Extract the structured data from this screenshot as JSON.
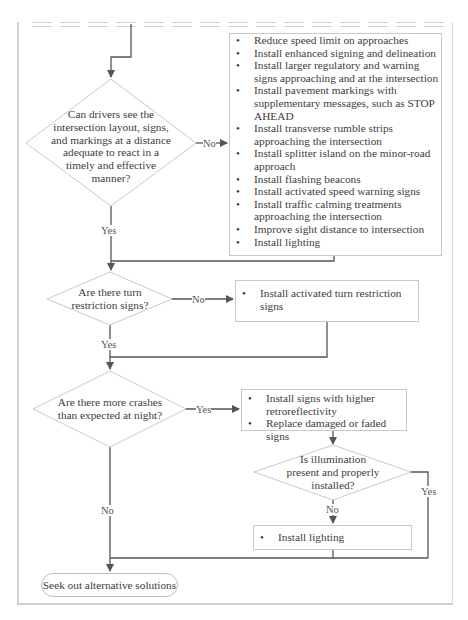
{
  "flowchart": {
    "decision_1": {
      "question": "Can drivers see the intersection layout, signs, and markings at a distance adequate to react in a timely and effective manner?",
      "lines": [
        "Can drivers see the",
        "intersection layout, signs,",
        "and markings at a distance",
        "adequate to react in a",
        "timely and effective",
        "manner?"
      ],
      "no_label": "No",
      "yes_label": "Yes"
    },
    "actions_1": [
      "Reduce speed limit on approaches",
      "Install enhanced signing and delineation",
      "Install larger regulatory and warning signs approaching and at the intersection",
      "Install pavement markings with supplementary messages, such as STOP AHEAD",
      "Install transverse rumble strips approaching the intersection",
      "Install splitter island on the minor-road approach",
      "Install flashing beacons",
      "Install activated speed warning signs",
      "Install traffic calming treatments approaching the intersection",
      "Improve sight distance to intersection",
      "Install lighting"
    ],
    "decision_2": {
      "lines": [
        "Are there turn",
        "restriction signs?"
      ],
      "no_label": "No",
      "yes_label": "Yes"
    },
    "actions_2": [
      "Install activated turn restriction signs"
    ],
    "decision_3": {
      "lines": [
        "Are there more crashes",
        "than expected at night?"
      ],
      "yes_label": "Yes",
      "no_label": "No"
    },
    "actions_3": [
      "Install signs with higher retroreflectivity",
      "Replace damaged or faded signs"
    ],
    "decision_4": {
      "lines": [
        "Is illumination",
        "present and properly",
        "installed?"
      ],
      "no_label": "No",
      "yes_label": "Yes"
    },
    "actions_4": [
      "Install lighting"
    ],
    "terminal": "Seek out alternative solutions"
  },
  "colors": {
    "connector": "#555555",
    "shape_border": "#c9c9c9",
    "text": "#404040"
  }
}
